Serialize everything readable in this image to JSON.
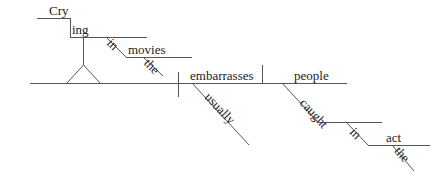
{
  "diagram": {
    "type": "sentence-diagram",
    "sentence": "Crying in the movies usually embarrasses people caught in the act",
    "words": {
      "cry": "Cry",
      "ing": "ing",
      "in1": "in",
      "movies": "movies",
      "the1": "the",
      "embarrasses": "embarrasses",
      "usually": "usually",
      "people": "people",
      "caught": "caught",
      "in2": "in",
      "act": "act",
      "the2": "the"
    },
    "line_color": "#555555",
    "text_color": "#222222"
  }
}
